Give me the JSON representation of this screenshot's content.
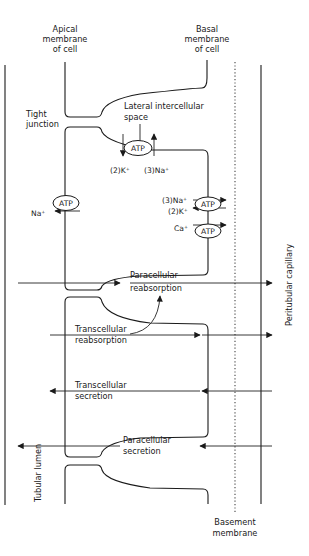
{
  "labels": {
    "apical_membrane": [
      "Apical",
      "membrane",
      "of cell"
    ],
    "basal_membrane": [
      "Basal",
      "membrane",
      "of cell"
    ],
    "tight_junction": [
      "Tight",
      "junction"
    ],
    "lateral_space": [
      "Lateral intercellular",
      "space"
    ],
    "basement_membrane": [
      "Basement",
      "membrane"
    ],
    "tubular_lumen": "Tubular lumen",
    "peritubular_capillary": "Peritubular capillary"
  },
  "pumps": {
    "lateral_pump": {
      "label": "ATP",
      "out_ion": "(2)K⁺",
      "in_ion": "(3)Na⁺"
    },
    "apical_pump": {
      "label": "ATP",
      "ion": "Na⁺"
    },
    "basal_pump_1": {
      "label": "ATP",
      "ion_out": "(3)Na⁺",
      "ion_in": "(2)K⁺"
    },
    "basal_pump_2": {
      "label": "ATP",
      "ion": "Ca⁺"
    }
  },
  "pathways": [
    {
      "name": "paracellular-reabsorption",
      "lines": [
        "Paracellular",
        "reabsorption"
      ],
      "direction": "to-capillary"
    },
    {
      "name": "transcellular-reabsorption",
      "lines": [
        "Transcellular",
        "reabsorption"
      ],
      "direction": "to-capillary"
    },
    {
      "name": "transcellular-secretion",
      "lines": [
        "Transcellular",
        "secretion"
      ],
      "direction": "to-lumen"
    },
    {
      "name": "paracellular-secretion",
      "lines": [
        "Paracellular",
        "secretion"
      ],
      "direction": "to-lumen"
    }
  ]
}
